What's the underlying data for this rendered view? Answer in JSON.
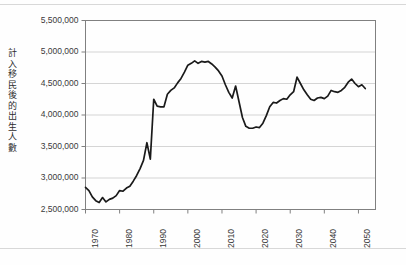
{
  "figure": {
    "name": "births-including-immigration-projection-chart"
  },
  "chart_data": {
    "type": "line",
    "title": "",
    "subtitle": "",
    "xlabel": "",
    "ylabel": "計入移民後的出生人數",
    "xlim": [
      1970,
      2055
    ],
    "ylim": [
      2500000,
      5500000
    ],
    "grid": true,
    "grid_axis": "y",
    "legend": false,
    "legend_position": "none",
    "line_color": "#1a1a1a",
    "plot_border_color": "#808080",
    "gridline_color": "#d0d0d0",
    "background_color": "#ffffff",
    "y_ticks": [
      2500000,
      3000000,
      3500000,
      4000000,
      4500000,
      5000000,
      5500000
    ],
    "y_tick_labels": [
      "2,500,000",
      "3,000,000",
      "3,500,000",
      "4,000,000",
      "4,500,000",
      "5,000,000",
      "5,500,000"
    ],
    "x_ticks": [
      1970,
      1980,
      1990,
      2000,
      2010,
      2020,
      2030,
      2040,
      2050
    ],
    "x_tick_labels": [
      "1970",
      "1980",
      "1990",
      "2000",
      "2010",
      "2020",
      "2030",
      "2040",
      "2050"
    ],
    "series": [
      {
        "name": "計入移民後的出生人數",
        "x": [
          1970,
          1971,
          1972,
          1973,
          1974,
          1975,
          1976,
          1977,
          1978,
          1979,
          1980,
          1981,
          1982,
          1983,
          1984,
          1985,
          1986,
          1987,
          1988,
          1989,
          1990,
          1991,
          1992,
          1993,
          1994,
          1995,
          1996,
          1997,
          1998,
          1999,
          2000,
          2001,
          2002,
          2003,
          2004,
          2005,
          2006,
          2007,
          2008,
          2009,
          2010,
          2011,
          2012,
          2013,
          2014,
          2015,
          2016,
          2017,
          2018,
          2019,
          2020,
          2021,
          2022,
          2023,
          2024,
          2025,
          2026,
          2027,
          2028,
          2029,
          2030,
          2031,
          2032,
          2033,
          2034,
          2035,
          2036,
          2037,
          2038,
          2039,
          2040,
          2041,
          2042,
          2043,
          2044,
          2045,
          2046,
          2047,
          2048,
          2049,
          2050,
          2051,
          2052
        ],
        "values": [
          2850000,
          2800000,
          2700000,
          2640000,
          2610000,
          2690000,
          2620000,
          2660000,
          2680000,
          2720000,
          2800000,
          2790000,
          2840000,
          2870000,
          2950000,
          3040000,
          3150000,
          3280000,
          3560000,
          3300000,
          4250000,
          4140000,
          4130000,
          4130000,
          4330000,
          4390000,
          4430000,
          4510000,
          4580000,
          4680000,
          4790000,
          4820000,
          4860000,
          4820000,
          4850000,
          4840000,
          4850000,
          4810000,
          4760000,
          4700000,
          4620000,
          4480000,
          4360000,
          4270000,
          4460000,
          4210000,
          3960000,
          3820000,
          3790000,
          3790000,
          3810000,
          3800000,
          3870000,
          3990000,
          4130000,
          4200000,
          4190000,
          4230000,
          4260000,
          4250000,
          4320000,
          4370000,
          4600000,
          4500000,
          4400000,
          4320000,
          4250000,
          4230000,
          4270000,
          4280000,
          4260000,
          4300000,
          4390000,
          4370000,
          4360000,
          4390000,
          4440000,
          4520000,
          4570000,
          4500000,
          4450000,
          4480000,
          4420000
        ]
      }
    ]
  }
}
